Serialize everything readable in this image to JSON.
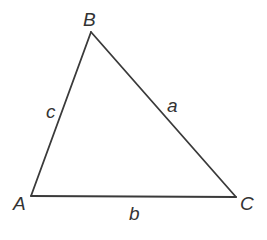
{
  "diagram": {
    "type": "triangle",
    "vertices": {
      "A": {
        "label": "A",
        "x": 31,
        "y": 196
      },
      "B": {
        "label": "B",
        "x": 91,
        "y": 32
      },
      "C": {
        "label": "C",
        "x": 236,
        "y": 197
      }
    },
    "sides": {
      "a": {
        "label": "a",
        "from": "B",
        "to": "C"
      },
      "b": {
        "label": "b",
        "from": "A",
        "to": "C"
      },
      "c": {
        "label": "c",
        "from": "A",
        "to": "B"
      }
    },
    "colors": {
      "line": "#3a3a3a",
      "text": "#333333",
      "background": "#ffffff"
    }
  }
}
